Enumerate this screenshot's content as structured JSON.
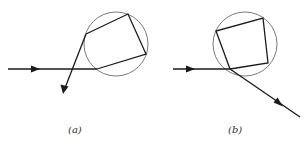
{
  "figure": {
    "colors": {
      "ray": "#1a1a1a",
      "circle": "#6a6a6a",
      "caption": "#333333"
    },
    "panels": [
      {
        "id": "a",
        "caption": "(a)",
        "circle": {
          "cx": 116,
          "cy": 44,
          "r": 32
        },
        "incoming_ray": {
          "x1": 8,
          "y1": 69,
          "x2": 97,
          "y2": 69,
          "arrow_at": [
            38,
            69
          ]
        },
        "path_points": [
          [
            97,
            69
          ],
          [
            146,
            54
          ],
          [
            128,
            14
          ],
          [
            86,
            34
          ]
        ],
        "exit_ray": {
          "x1": 86,
          "y1": 34,
          "x2": 63,
          "y2": 93
        }
      },
      {
        "id": "b",
        "caption": "(b)",
        "circle": {
          "cx": 245,
          "cy": 44,
          "r": 32
        },
        "incoming_ray": {
          "x1": 173,
          "y1": 69,
          "x2": 230,
          "y2": 69,
          "arrow_at": [
            191,
            69
          ]
        },
        "path_points": [
          [
            230,
            69
          ],
          [
            268,
            63
          ],
          [
            263,
            18
          ],
          [
            216,
            31
          ]
        ],
        "exit_ray": {
          "x1": 230,
          "y1": 69,
          "x2": 300,
          "y2": 117,
          "arrow_at": [
            280,
            104
          ]
        }
      }
    ]
  }
}
